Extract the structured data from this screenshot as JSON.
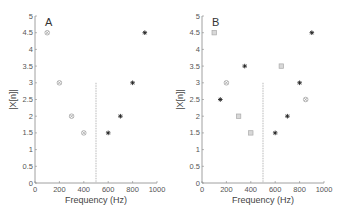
{
  "chart_data": [
    {
      "type": "scatter",
      "panel_label": "A",
      "xlabel": "Frequency (Hz)",
      "ylabel": "|X[n]|",
      "xlim": [
        0,
        1000
      ],
      "ylim": [
        0,
        5
      ],
      "xticks": [
        0,
        200,
        400,
        600,
        800,
        1000
      ],
      "yticks": [
        0,
        0.5,
        1,
        1.5,
        2,
        2.5,
        3,
        3.5,
        4,
        4.5,
        5
      ],
      "grid": false,
      "vline": {
        "x": 500,
        "y_from": 0,
        "y_to": 3,
        "style": "dashed",
        "color": "#999999"
      },
      "series": [
        {
          "name": "grey-circle-x",
          "marker": "circle-x",
          "color": "#999999",
          "points": [
            [
              100,
              4.5
            ],
            [
              200,
              3
            ],
            [
              300,
              2
            ],
            [
              400,
              1.5
            ]
          ]
        },
        {
          "name": "black-asterisk",
          "marker": "asterisk",
          "color": "#222222",
          "points": [
            [
              600,
              1.5
            ],
            [
              700,
              2
            ],
            [
              800,
              3
            ],
            [
              900,
              4.5
            ]
          ]
        }
      ]
    },
    {
      "type": "scatter",
      "panel_label": "B",
      "xlabel": "Frequency (Hz)",
      "ylabel": "|X[n]|",
      "xlim": [
        0,
        1000
      ],
      "ylim": [
        0,
        5
      ],
      "xticks": [
        0,
        200,
        400,
        600,
        800,
        1000
      ],
      "yticks": [
        0,
        0.5,
        1,
        1.5,
        2,
        2.5,
        3,
        3.5,
        4,
        4.5,
        5
      ],
      "grid": false,
      "vline": {
        "x": 500,
        "y_from": 0,
        "y_to": 3,
        "style": "dashed",
        "color": "#999999"
      },
      "series": [
        {
          "name": "grey-square",
          "marker": "square",
          "color": "#aaaaaa",
          "points": [
            [
              100,
              4.5
            ],
            [
              300,
              2
            ],
            [
              400,
              1.5
            ],
            [
              650,
              3.5
            ]
          ]
        },
        {
          "name": "grey-circle-x",
          "marker": "circle-x",
          "color": "#999999",
          "points": [
            [
              200,
              3
            ],
            [
              850,
              2.5
            ]
          ]
        },
        {
          "name": "black-asterisk",
          "marker": "asterisk",
          "color": "#222222",
          "points": [
            [
              150,
              2.5
            ],
            [
              350,
              3.5
            ],
            [
              600,
              1.5
            ],
            [
              700,
              2
            ],
            [
              800,
              3
            ],
            [
              900,
              4.5
            ]
          ]
        }
      ]
    }
  ]
}
